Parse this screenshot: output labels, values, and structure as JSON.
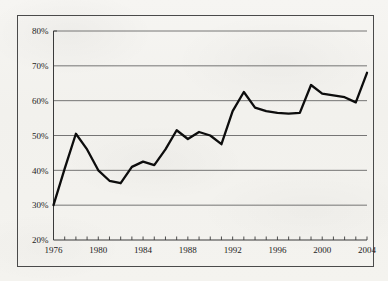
{
  "chart_data": {
    "type": "line",
    "title": "",
    "subtitle": "",
    "xlabel": "",
    "ylabel": "",
    "legend": [],
    "legend_position": "none",
    "grid": true,
    "grid_axis": "y",
    "xlim": [
      1976,
      2004
    ],
    "ylim": [
      20,
      80
    ],
    "ytick_step": 10,
    "ytick_format": "percent",
    "xtick_step": 1,
    "xtick_label_step": 4,
    "ytick_labels": [
      "20%",
      "30%",
      "40%",
      "50%",
      "60%",
      "70%",
      "80%"
    ],
    "ytick_values": [
      20,
      30,
      40,
      50,
      60,
      70,
      80
    ],
    "xtick_labels": [
      "1976",
      "1980",
      "1984",
      "1988",
      "1992",
      "1996",
      "2000",
      "2004"
    ],
    "xtick_values": [
      1976,
      1980,
      1984,
      1988,
      1992,
      1996,
      2000,
      2004
    ],
    "x": [
      1976,
      1977,
      1978,
      1979,
      1980,
      1981,
      1982,
      1983,
      1984,
      1985,
      1986,
      1987,
      1988,
      1989,
      1990,
      1991,
      1992,
      1993,
      1994,
      1995,
      1996,
      1997,
      1998,
      1999,
      2000,
      2001,
      2002,
      2003,
      2004
    ],
    "values": [
      30.0,
      40.5,
      50.5,
      46.0,
      40.0,
      37.0,
      36.3,
      41.0,
      42.5,
      41.5,
      46.0,
      51.5,
      49.0,
      51.0,
      50.0,
      47.5,
      57.0,
      62.5,
      58.0,
      57.0,
      56.5,
      56.3,
      56.5,
      64.5,
      62.0,
      61.5,
      61.0,
      59.5,
      68.0
    ],
    "series": [
      {
        "name": "series-1",
        "color": "#0d0d0d",
        "values": [
          30.0,
          40.5,
          50.5,
          46.0,
          40.0,
          37.0,
          36.3,
          41.0,
          42.5,
          41.5,
          46.0,
          51.5,
          49.0,
          51.0,
          50.0,
          47.5,
          57.0,
          62.5,
          58.0,
          57.0,
          56.5,
          56.3,
          56.5,
          64.5,
          62.0,
          61.5,
          61.0,
          59.5,
          68.0
        ]
      }
    ],
    "colors": {
      "line": "#0d0d0d",
      "grid": "#555555",
      "axis": "#3a3a3a",
      "text": "#1c1c1c",
      "background": "#f4f3f0",
      "frame_border": "#4a4a4a"
    }
  }
}
